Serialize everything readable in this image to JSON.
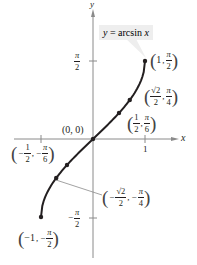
{
  "chart_data": {
    "type": "line",
    "title": "y = arcsin x",
    "function_label": "y = arcsin x",
    "xlabel": "x",
    "ylabel": "y",
    "xlim": [
      -1.5,
      1.6
    ],
    "ylim": [
      -2.0,
      2.1
    ],
    "grid": false,
    "x_ticks": [
      {
        "value": -1,
        "label": ""
      },
      {
        "value": 1,
        "label": "1"
      }
    ],
    "y_ticks": [
      {
        "value": 1.5708,
        "label": "π/2",
        "num": "π",
        "den": "2",
        "sign": ""
      },
      {
        "value": -1.5708,
        "label": "-π/2",
        "num": "π",
        "den": "2",
        "sign": "−"
      }
    ],
    "series": [
      {
        "name": "y = arcsin x",
        "x": [
          -1,
          -0.866,
          -0.7071,
          -0.5,
          -0.25,
          0,
          0.25,
          0.5,
          0.7071,
          0.866,
          1
        ],
        "y": [
          -1.5708,
          -1.0472,
          -0.7854,
          -0.5236,
          -0.2527,
          0,
          0.2527,
          0.5236,
          0.7854,
          1.0472,
          1.5708
        ]
      }
    ],
    "points": [
      {
        "x": 1,
        "y": 1.5708,
        "label": "(1, π/2)"
      },
      {
        "x": 0.7071,
        "y": 0.7854,
        "label": "(√2/2, π/4)"
      },
      {
        "x": 0.5,
        "y": 0.5236,
        "label": "(1/2, π/6)"
      },
      {
        "x": 0,
        "y": 0,
        "label": "(0, 0)"
      },
      {
        "x": -0.5,
        "y": -0.5236,
        "label": "(−1/2, −π/6)"
      },
      {
        "x": -0.7071,
        "y": -0.7854,
        "label": "(−√2/2, −π/4)"
      },
      {
        "x": -1,
        "y": -1.5708,
        "label": "(−1, −π/2)"
      }
    ]
  },
  "labels": {
    "axis_x": "x",
    "axis_y": "y",
    "func_y": "y",
    "func_eq": " = arcsin ",
    "func_x": "x",
    "tick_one": "1",
    "pi": "π",
    "two": "2",
    "four": "4",
    "six": "6",
    "one": "1",
    "root2": "√2",
    "neg": "−",
    "neg_one": "−1",
    "comma": ",",
    "origin": "(0, 0)",
    "lparen": "(",
    "rparen": ")"
  }
}
